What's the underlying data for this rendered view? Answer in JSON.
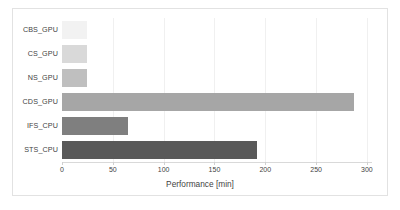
{
  "chart_data": {
    "type": "bar",
    "orientation": "horizontal",
    "title": "",
    "xlabel": "Performance [min]",
    "ylabel": "",
    "categories": [
      "CBS_GPU",
      "CS_GPU",
      "NS_GPU",
      "CDS_GPU",
      "IFS_CPU",
      "STS_CPU"
    ],
    "values": [
      25,
      25,
      25,
      287,
      65,
      192
    ],
    "series": [
      {
        "name": "Performance",
        "values": [
          25,
          25,
          25,
          287,
          65,
          192
        ]
      }
    ],
    "bar_colors": [
      "#f2f2f2",
      "#d9d9d9",
      "#bfbfbf",
      "#a6a6a6",
      "#7f7f7f",
      "#595959"
    ],
    "xlim": [
      0,
      305
    ],
    "xticks": [
      0,
      50,
      100,
      150,
      200,
      250,
      300
    ],
    "xtick_labels": [
      "0",
      "50",
      "100",
      "150",
      "200",
      "250",
      "300"
    ],
    "grid": "vertical",
    "legend": "none",
    "frame_color": "#e2e2e2",
    "gridline_color": "#f0f0f0",
    "text_color": "#3f3f3f"
  }
}
